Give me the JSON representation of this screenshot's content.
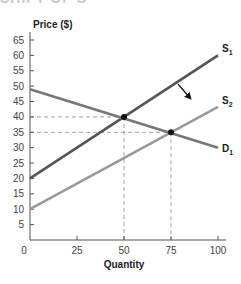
{
  "header_cutoff": "SHIFT OF S",
  "chart_data": {
    "type": "line",
    "title": "",
    "xlabel": "Quantity",
    "ylabel": "Price ($)",
    "xlim": [
      0,
      100
    ],
    "ylim": [
      0,
      65
    ],
    "x_ticks": [
      0,
      25,
      50,
      75,
      100
    ],
    "y_ticks": [
      5,
      10,
      15,
      20,
      25,
      30,
      35,
      40,
      45,
      50,
      55,
      60,
      65
    ],
    "grid": false,
    "series": [
      {
        "name": "S",
        "subscript": "1",
        "x": [
          0,
          100
        ],
        "y": [
          20,
          60
        ],
        "color": "#555555"
      },
      {
        "name": "S",
        "subscript": "2",
        "x": [
          0,
          100
        ],
        "y": [
          10,
          43.3
        ],
        "color": "#9a9a9a"
      },
      {
        "name": "D",
        "subscript": "1",
        "x": [
          0,
          100
        ],
        "y": [
          49,
          30
        ],
        "color": "#777777"
      }
    ],
    "equilibria": [
      {
        "label": "E1",
        "x": 50,
        "y": 40
      },
      {
        "label": "E2",
        "x": 75,
        "y": 35
      }
    ],
    "guide_lines": [
      {
        "x": 50,
        "y": 40
      },
      {
        "x": 75,
        "y": 35
      }
    ],
    "annotations": [
      {
        "type": "arrow",
        "meaning": "supply shifts right from S1 to S2"
      }
    ]
  }
}
